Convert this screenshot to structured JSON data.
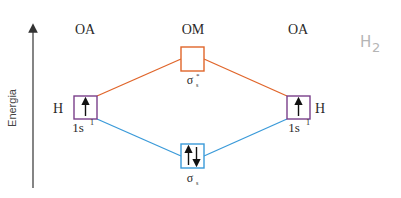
{
  "diagram": {
    "title_note": "H2",
    "axis": {
      "label": "Energia"
    },
    "columns": {
      "left": "OA",
      "center": "OM",
      "right": "OA"
    },
    "atoms": {
      "left": {
        "symbol": "H",
        "orbital": "1s",
        "superscript": "1",
        "electrons": "up"
      },
      "right": {
        "symbol": "H",
        "orbital": "1s",
        "superscript": "1",
        "electrons": "up"
      }
    },
    "molecular_orbitals": {
      "antibonding": {
        "label": "σ",
        "subscript": "s",
        "superscript": "*",
        "electrons": "empty"
      },
      "bonding": {
        "label": "σ",
        "subscript": "s",
        "electrons": "up-down"
      }
    },
    "colors": {
      "antibonding_line": "#e0652a",
      "bonding_line": "#3a9ad9",
      "atomic_box": "#7a3f8a",
      "antibonding_box": "#e0652a",
      "bonding_box": "#3a9ad9",
      "axis": "#333333",
      "note": "#b5b5b5"
    }
  }
}
